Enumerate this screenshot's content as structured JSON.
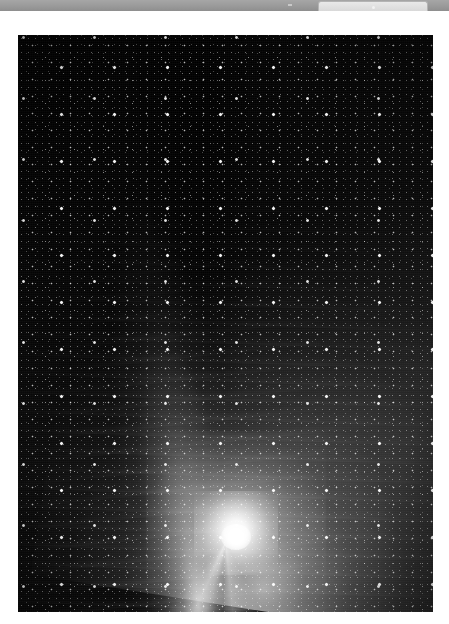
{
  "window": {
    "toolbar_label": "",
    "tab_label": "",
    "background_color": "#ffffff",
    "toolbar_color": "#9a9a9a",
    "tab_color": "#dcdcdc"
  },
  "photo": {
    "caption": "",
    "alt": "comet-astrophotograph",
    "subject": "comet",
    "background_color": "#050505",
    "coma_color": "#ffffff",
    "tail_color": "#c8c8c8",
    "star_color": "#ffffff",
    "frame": {
      "left": 18,
      "top": 24,
      "width": 415,
      "height": 577
    },
    "features": [
      {
        "name": "coma",
        "label": "",
        "center_x": 218,
        "center_y": 508
      },
      {
        "name": "dust-tail",
        "label": ""
      },
      {
        "name": "ion-tail-streak",
        "label": ""
      },
      {
        "name": "dark-lane",
        "label": ""
      },
      {
        "name": "starfield",
        "label": ""
      }
    ]
  },
  "icons": {
    "tab_dot": "dot-icon",
    "toolbar_tick": "tick-icon"
  }
}
